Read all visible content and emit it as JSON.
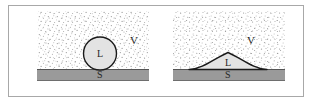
{
  "figure": {
    "domain": "wetting-contact-angle-diagram",
    "caption": "",
    "frame": {
      "border_color": "#a8a8a8",
      "background": "#ffffff"
    },
    "palette": {
      "vapor_stipple": "#8c8c8c",
      "vapor_background": "#ffffff",
      "liquid_fill": "#e2e2e2",
      "liquid_outline": "#1a1a1a",
      "solid_fill": "#9a9a9a",
      "solid_outline": "#4d4d4d",
      "label_color": "#262626"
    },
    "phases": [
      {
        "symbol": "V",
        "name": "vapor"
      },
      {
        "symbol": "L",
        "name": "liquid"
      },
      {
        "symbol": "S",
        "name": "solid"
      }
    ],
    "panels": [
      {
        "id": "non-wetting",
        "name": "non-wetting-droplet",
        "description": "Spherical liquid droplet resting on a solid substrate, high contact angle",
        "labels": {
          "vapor": "V",
          "liquid": "L",
          "solid": "S"
        },
        "geometry": {
          "droplet_shape": "circle",
          "droplet_center_x": 71,
          "droplet_center_y": 48,
          "droplet_radius": 17,
          "substrate_top_y": 63,
          "substrate_bottom_y": 75
        }
      },
      {
        "id": "wetting",
        "name": "wetting-droplet",
        "description": "Flattened liquid droplet spread across a solid substrate, low contact angle",
        "labels": {
          "vapor": "V",
          "liquid": "L",
          "solid": "S"
        },
        "geometry": {
          "droplet_shape": "dome",
          "droplet_left_x": 22,
          "droplet_right_x": 100,
          "droplet_apex_x": 61,
          "droplet_apex_y": 47,
          "substrate_top_y": 63,
          "substrate_bottom_y": 75
        }
      }
    ]
  }
}
